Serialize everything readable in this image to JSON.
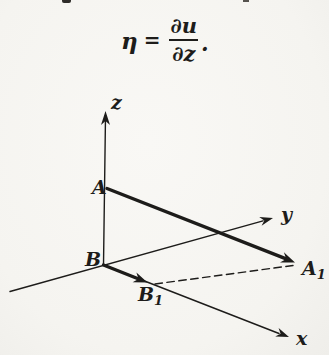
{
  "formula": {
    "lhs": "η",
    "equals": "=",
    "numerator": "∂u",
    "denominator": "∂z",
    "period": "."
  },
  "diagram": {
    "axis_labels": {
      "z": "z",
      "y": "y",
      "x": "x"
    },
    "point_labels": {
      "A": {
        "main": "A",
        "sub": ""
      },
      "B": {
        "main": "B",
        "sub": ""
      },
      "A1": {
        "main": "A",
        "sub": "1"
      },
      "B1": {
        "main": "B",
        "sub": "1"
      }
    }
  },
  "colors": {
    "ink": "#1d1c1a",
    "paper": "#f6f5f1"
  }
}
